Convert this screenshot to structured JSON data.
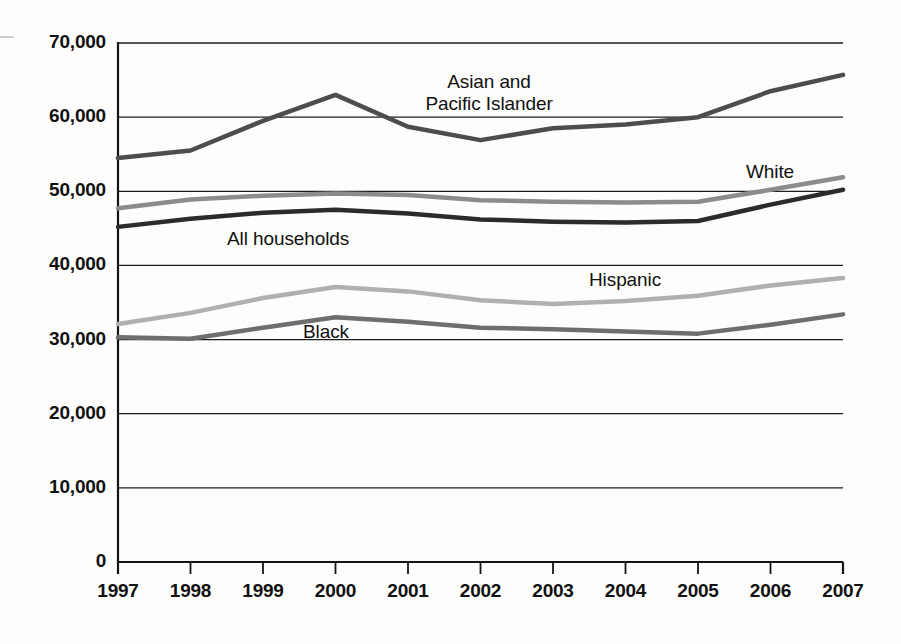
{
  "chart_data": {
    "type": "line",
    "title": "",
    "subtitle": "",
    "xlabel": "",
    "ylabel": "",
    "x": [
      1997,
      1998,
      1999,
      2000,
      2001,
      2002,
      2003,
      2004,
      2005,
      2006,
      2007
    ],
    "categories": [
      "1997",
      "1998",
      "1999",
      "2000",
      "2001",
      "2002",
      "2003",
      "2004",
      "2005",
      "2006",
      "2007"
    ],
    "xlim": [
      1997,
      2007
    ],
    "ylim": [
      0,
      70000
    ],
    "yticks": [
      0,
      10000,
      20000,
      30000,
      40000,
      50000,
      60000,
      70000
    ],
    "ytick_labels": [
      "0",
      "10,000",
      "20,000",
      "30,000",
      "40,000",
      "50,000",
      "60,000",
      "70,000"
    ],
    "grid": true,
    "grid_axis": "y",
    "legend": "inline-annotations",
    "series": [
      {
        "name": "Asian and Pacific Islander",
        "color": "#4d4d4d",
        "width": 4.5,
        "values": [
          54500,
          55500,
          59500,
          63000,
          58700,
          56900,
          58500,
          59000,
          60000,
          63500,
          65700
        ]
      },
      {
        "name": "White",
        "color": "#8c8c8c",
        "width": 4.5,
        "values": [
          47700,
          48900,
          49400,
          49700,
          49500,
          48800,
          48600,
          48500,
          48600,
          50200,
          51900
        ]
      },
      {
        "name": "All households",
        "color": "#2b2b2b",
        "width": 4.5,
        "values": [
          45200,
          46300,
          47100,
          47500,
          47000,
          46200,
          45900,
          45800,
          46000,
          48200,
          50200
        ]
      },
      {
        "name": "Hispanic",
        "color": "#b0b0b0",
        "width": 4.5,
        "values": [
          32100,
          33600,
          35600,
          37100,
          36500,
          35300,
          34800,
          35200,
          35900,
          37300,
          38300
        ]
      },
      {
        "name": "Black",
        "color": "#6e6e6e",
        "width": 4.5,
        "values": [
          30300,
          30100,
          31600,
          33000,
          32400,
          31600,
          31400,
          31100,
          30800,
          32000,
          33400
        ]
      }
    ],
    "annotations": [
      {
        "text": "Asian and\nPacific Islander",
        "line1": "Asian and",
        "line2": "Pacific Islander",
        "series": "Asian and Pacific Islander",
        "x_px": 489,
        "y_px": 71,
        "align": "center"
      },
      {
        "text": "White",
        "line1": "White",
        "line2": "",
        "series": "White",
        "x_px": 746,
        "y_px": 161,
        "align": "left"
      },
      {
        "text": "All households",
        "line1": "All households",
        "line2": "",
        "series": "All households",
        "x_px": 227,
        "y_px": 228,
        "align": "left"
      },
      {
        "text": "Hispanic",
        "line1": "Hispanic",
        "line2": "",
        "series": "Hispanic",
        "x_px": 589,
        "y_px": 269,
        "align": "left"
      },
      {
        "text": "Black",
        "line1": "Black",
        "line2": "",
        "series": "Black",
        "x_px": 303,
        "y_px": 321,
        "align": "left"
      }
    ]
  },
  "axes": {
    "axis_color": "#141414",
    "grid_color": "#1c1c1c",
    "plot_left_px": 118,
    "plot_right_px": 843,
    "plot_top_px": 43,
    "plot_bottom_px": 562
  }
}
